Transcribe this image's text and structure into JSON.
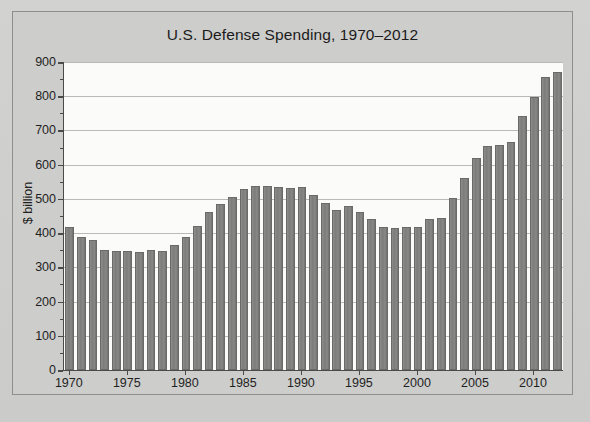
{
  "chart_data": {
    "type": "bar",
    "title": "U.S. Defense Spending, 1970–2012",
    "xlabel": "",
    "ylabel": "$ billion",
    "ylim": [
      0,
      900
    ],
    "ytick_step": 100,
    "yticks": [
      0,
      100,
      200,
      300,
      400,
      500,
      600,
      700,
      800,
      900
    ],
    "ytick_labels": [
      "0",
      "100",
      "200",
      "300",
      "400",
      "500",
      "600",
      "700",
      "800",
      "900"
    ],
    "xticks": [
      1970,
      1975,
      1980,
      1985,
      1990,
      1995,
      2000,
      2005,
      2010
    ],
    "xtick_labels": [
      "1970",
      "1975",
      "1980",
      "1985",
      "1990",
      "1995",
      "2000",
      "2005",
      "2010"
    ],
    "xlim": [
      1969.5,
      2012.5
    ],
    "grid": "horizontal",
    "legend": "none",
    "bar_color": "#7f7f7d",
    "plot_background": "#fbfbfa",
    "figure_background": "#cdcdcb",
    "categories": [
      "1970",
      "1971",
      "1972",
      "1973",
      "1974",
      "1975",
      "1976",
      "1977",
      "1978",
      "1979",
      "1980",
      "1981",
      "1982",
      "1983",
      "1984",
      "1985",
      "1986",
      "1987",
      "1988",
      "1989",
      "1990",
      "1991",
      "1992",
      "1993",
      "1994",
      "1995",
      "1996",
      "1997",
      "1998",
      "1999",
      "2000",
      "2001",
      "2002",
      "2003",
      "2004",
      "2005",
      "2006",
      "2007",
      "2008",
      "2009",
      "2010",
      "2011",
      "2012"
    ],
    "values": [
      417,
      388,
      381,
      352,
      347,
      347,
      346,
      350,
      349,
      364,
      388,
      421,
      461,
      486,
      506,
      528,
      538,
      538,
      536,
      533,
      535,
      510,
      489,
      468,
      480,
      462,
      440,
      418,
      414,
      418,
      417,
      442,
      445,
      502,
      562,
      619,
      655,
      658,
      665,
      741,
      799,
      856,
      870
    ],
    "series_name": "U.S. Defense Spending"
  },
  "figure": {
    "title": "U.S. Defense Spending, 1970–2012"
  }
}
